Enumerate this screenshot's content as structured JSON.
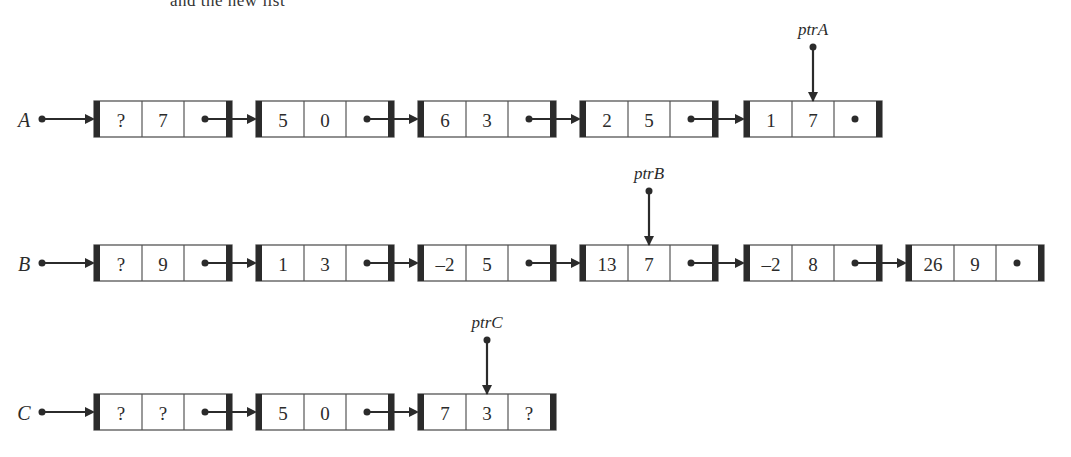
{
  "figure": {
    "type": "linked-list-diagram",
    "top_text_cutoff": "and the new list"
  },
  "style": {
    "ink_color": "#2b2b2b",
    "cell_border_color": "#555555",
    "end_bar_color": "#2b2b2b",
    "background": "#ffffff"
  },
  "layout": {
    "node_x": [
      94,
      256,
      418,
      580,
      744,
      906
    ],
    "node_width": 138,
    "row_y": {
      "A": 101,
      "B": 245,
      "C": 394
    },
    "row_height": 36
  },
  "lists": [
    {
      "name": "A",
      "head_label": "A",
      "nodes": [
        {
          "data": [
            "?",
            "7"
          ],
          "next": "link"
        },
        {
          "data": [
            "5",
            "0"
          ],
          "next": "link"
        },
        {
          "data": [
            "6",
            "3"
          ],
          "next": "link"
        },
        {
          "data": [
            "2",
            "5"
          ],
          "next": "link"
        },
        {
          "data": [
            "1",
            "7"
          ],
          "next": "null"
        }
      ],
      "pointer": {
        "label": "ptrA",
        "node_index": 4,
        "field_index": 1
      }
    },
    {
      "name": "B",
      "head_label": "B",
      "nodes": [
        {
          "data": [
            "?",
            "9"
          ],
          "next": "link"
        },
        {
          "data": [
            "1",
            "3"
          ],
          "next": "link"
        },
        {
          "data": [
            "–2",
            "5"
          ],
          "next": "link"
        },
        {
          "data": [
            "13",
            "7"
          ],
          "next": "link"
        },
        {
          "data": [
            "–2",
            "8"
          ],
          "next": "link"
        },
        {
          "data": [
            "26",
            "9"
          ],
          "next": "null"
        }
      ],
      "pointer": {
        "label": "ptrB",
        "node_index": 3,
        "field_index": 1
      }
    },
    {
      "name": "C",
      "head_label": "C",
      "nodes": [
        {
          "data": [
            "?",
            "?"
          ],
          "next": "link"
        },
        {
          "data": [
            "5",
            "0"
          ],
          "next": "link"
        },
        {
          "data": [
            "7",
            "3"
          ],
          "next": "unknown",
          "next_label": "?"
        }
      ],
      "pointer": {
        "label": "ptrC",
        "node_index": 2,
        "field_index": 1
      }
    }
  ]
}
